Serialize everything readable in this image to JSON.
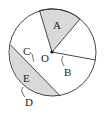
{
  "diagram": {
    "title": "",
    "labels": {
      "sector": "A",
      "center": "O",
      "angle": "B",
      "chord": "C",
      "segment": "E",
      "arc": "D"
    },
    "colors": {
      "stroke": "#333333",
      "shade": "#d9d9d9",
      "background": "#ffffff"
    }
  }
}
